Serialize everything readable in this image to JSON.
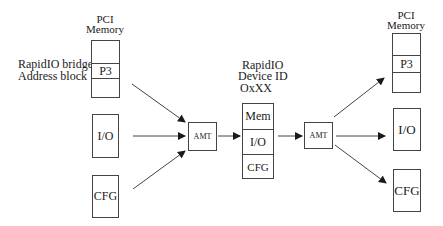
{
  "diagram": {
    "left": {
      "pci_memory_label": [
        "PCI",
        "Memory"
      ],
      "bridge_label": [
        "RapidIO bridge",
        "Address block"
      ],
      "pci_block_cells": [
        "",
        "P3",
        ""
      ],
      "io_label": "I/O",
      "cfg_label": "CFG"
    },
    "amt_left": {
      "label": "AMT"
    },
    "middle": {
      "device_label": [
        "RapidIO",
        "Device ID",
        "OxXX"
      ],
      "cells": [
        "Mem",
        "I/O",
        "CFG"
      ]
    },
    "amt_right": {
      "label": "AMT"
    },
    "right": {
      "pci_memory_label": [
        "PCI",
        "Memory"
      ],
      "pci_block_cells": [
        "",
        "P3",
        ""
      ],
      "io_label": "I/O",
      "cfg_label": "CFG"
    },
    "colors": {
      "line": "#444444",
      "arrow": "#1a1a1a",
      "background": "#ffffff"
    }
  }
}
